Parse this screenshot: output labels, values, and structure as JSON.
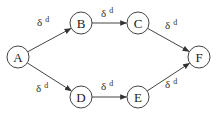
{
  "diagram": {
    "nodes": [
      {
        "id": "A",
        "label": "A",
        "cx": 18,
        "cy": 57
      },
      {
        "id": "B",
        "label": "B",
        "cx": 81,
        "cy": 23
      },
      {
        "id": "C",
        "label": "C",
        "cx": 138,
        "cy": 23
      },
      {
        "id": "D",
        "label": "D",
        "cx": 81,
        "cy": 97
      },
      {
        "id": "E",
        "label": "E",
        "cx": 138,
        "cy": 97
      },
      {
        "id": "F",
        "label": "F",
        "cx": 199,
        "cy": 57
      }
    ],
    "radius": 11,
    "edges": [
      {
        "from": "A",
        "to": "B",
        "label": "δ",
        "sup": "d",
        "lx": 37,
        "ly": 26
      },
      {
        "from": "B",
        "to": "C",
        "label": "δ",
        "sup": "d",
        "lx": 101,
        "ly": 17
      },
      {
        "from": "C",
        "to": "F",
        "label": "δ",
        "sup": "d",
        "lx": 165,
        "ly": 29
      },
      {
        "from": "A",
        "to": "D",
        "label": "δ",
        "sup": "d",
        "lx": 36,
        "ly": 92
      },
      {
        "from": "D",
        "to": "E",
        "label": "δ",
        "sup": "d",
        "lx": 101,
        "ly": 90
      },
      {
        "from": "E",
        "to": "F",
        "label": "δ",
        "sup": "d",
        "lx": 165,
        "ly": 88
      }
    ],
    "colors": {
      "stroke": "#444444",
      "text": "#222222",
      "background": "#ffffff"
    }
  }
}
